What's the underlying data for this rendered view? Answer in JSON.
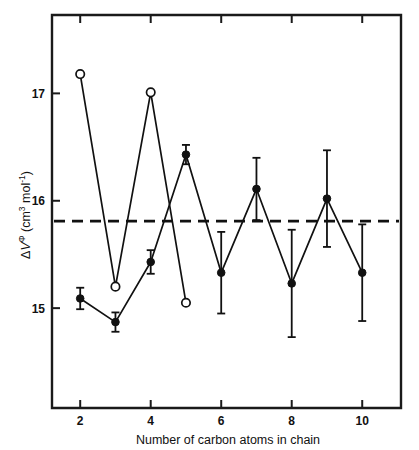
{
  "chart_data": {
    "type": "line",
    "title": "",
    "subtitle": "",
    "xlabel": "Number of carbon atoms in chain",
    "ylabel": "ΔVᵠ (cm³ mol⁻¹)",
    "ylabel_parts": {
      "delta": "Δ",
      "symbol": "V",
      "superscript_phi": "Φ",
      "units_prefix": " (cm",
      "units_exp1": "3",
      "units_mid": " mol",
      "units_exp2": "-1",
      "units_suffix": ")"
    },
    "xlim": [
      1.2,
      11.1
    ],
    "ylim": [
      14.07,
      17.73
    ],
    "xticks": [
      2,
      4,
      6,
      8,
      10
    ],
    "xtick_labels": [
      "2",
      "4",
      "6",
      "8",
      "10"
    ],
    "yticks": [
      15,
      16,
      17
    ],
    "ytick_labels": [
      "15",
      "16",
      "17"
    ],
    "grid": false,
    "legend": "none",
    "reference_line": {
      "name": "dashed-reference",
      "value": 15.81,
      "style": "dashed",
      "orientation": "horizontal"
    },
    "series": [
      {
        "name": "open-circles",
        "marker": "open-circle",
        "x": [
          2,
          3,
          4,
          5
        ],
        "values": [
          17.18,
          15.2,
          17.01,
          15.05
        ],
        "errors": [
          null,
          null,
          null,
          null
        ]
      },
      {
        "name": "filled-circles",
        "marker": "filled-circle",
        "x": [
          2,
          3,
          4,
          5,
          6,
          7,
          8,
          9,
          10
        ],
        "values": [
          15.09,
          14.87,
          15.43,
          16.43,
          15.33,
          16.11,
          15.23,
          16.02,
          15.33
        ],
        "errors": [
          0.1,
          0.09,
          0.11,
          0.09,
          0.38,
          0.29,
          0.5,
          0.45,
          0.45
        ]
      }
    ]
  }
}
